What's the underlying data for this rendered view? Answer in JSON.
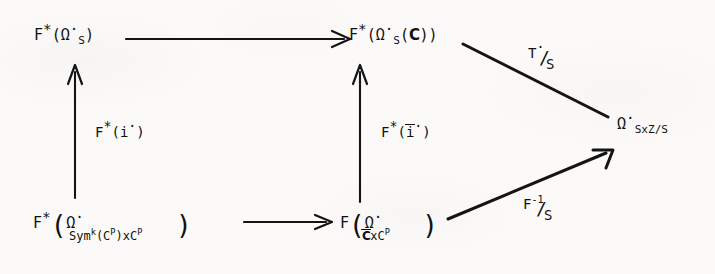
{
  "diagram": {
    "kind": "commutative-diagram",
    "title": "",
    "background_color": "#fbfaf8",
    "ink_color": "#151414",
    "nodes": [
      {
        "id": "top-left",
        "label": "F*(Ω'_S)",
        "parts": {
          "functor": "F",
          "star": "*",
          "open": "(",
          "omega": "Ω",
          "prime": "·",
          "sub": "S",
          "close": ")"
        }
      },
      {
        "id": "top-middle",
        "label": "F*(Ω'_S(C))",
        "parts": {
          "functor": "F",
          "star": "*",
          "open": "(",
          "omega": "Ω",
          "prime": "·",
          "sub": "S",
          "arg_open": "(",
          "arg": "C",
          "arg_close": ")",
          "close": ")"
        }
      },
      {
        "id": "right",
        "label": "Ω'_{SxZ/S}",
        "parts": {
          "omega": "Ω",
          "prime": "·",
          "sub": "SxZ/S"
        }
      },
      {
        "id": "bottom-left",
        "label": "F*(Ω'_{Sym^k(C^P)xC^P})",
        "parts": {
          "functor": "F",
          "star": "*",
          "open": "(",
          "omega": "Ω",
          "prime": "·",
          "close": ")",
          "sub_sym": "Sym",
          "sub_k": "k",
          "sub_c1": "(C",
          "sub_p1": "P",
          "sub_mid": ")xC",
          "sub_p2": "P"
        }
      },
      {
        "id": "bottom-middle",
        "label": "F(Ω'_{C̄xC^P})",
        "parts": {
          "functor": "F",
          "open": "(",
          "omega": "Ω",
          "prime": "·",
          "close": ")",
          "sub_cbar": "C",
          "sub_mid": "xC",
          "sub_p": "P"
        }
      }
    ],
    "edges": [
      {
        "id": "top-horizontal",
        "from": "top-left",
        "to": "top-middle",
        "label": "",
        "arrowhead": true
      },
      {
        "id": "bottom-horizontal",
        "from": "bottom-left",
        "to": "bottom-middle",
        "label": "",
        "arrowhead": true
      },
      {
        "id": "left-vertical",
        "from": "bottom-left",
        "to": "top-left",
        "label": "F*(i·)",
        "arrowhead": true
      },
      {
        "id": "middle-vertical",
        "from": "bottom-middle",
        "to": "top-middle",
        "label": "F*(ī·)",
        "arrowhead": true
      },
      {
        "id": "upper-diagonal",
        "from": "top-middle",
        "to": "right",
        "label": "T·/S",
        "arrowhead": false
      },
      {
        "id": "lower-diagonal",
        "from": "bottom-middle",
        "to": "right",
        "label": "F^-1/S",
        "arrowhead": true
      }
    ],
    "labels": {
      "left_vertical": {
        "functor": "F",
        "star": "*",
        "open": "(",
        "sym": "i",
        "prime": "·",
        "close": ")"
      },
      "middle_vertical": {
        "functor": "F",
        "star": "*",
        "open": "(",
        "sym": "i",
        "prime": "·",
        "close": ")"
      },
      "upper_diagonal": {
        "num": "T",
        "prime": "·",
        "slash": "/",
        "den": "S"
      },
      "lower_diagonal": {
        "num": "F",
        "exp": "-1",
        "slash": "/",
        "den": "S"
      }
    }
  }
}
